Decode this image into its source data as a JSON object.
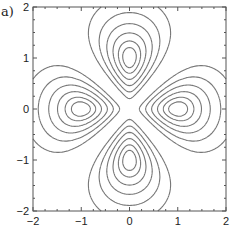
{
  "figure": {
    "label": "a)"
  },
  "chart_data": {
    "type": "contour",
    "title": "",
    "xlabel": "",
    "ylabel": "",
    "xlim": [
      -2,
      2
    ],
    "ylim": [
      -2,
      2
    ],
    "xticks": [
      -2,
      -1,
      0,
      1,
      2
    ],
    "yticks": [
      -2,
      -1,
      0,
      1,
      2
    ],
    "xtick_labels": [
      "−2",
      "−1",
      "0",
      "1",
      "2"
    ],
    "ytick_labels": [
      "−2",
      "−1",
      "0",
      "1",
      "2"
    ],
    "grid": false,
    "legend": null,
    "function": "r^2 * cos(2*theta)^2 * exp(-r^2)",
    "levels": [
      0.04,
      0.1,
      0.17,
      0.24,
      0.3,
      0.34
    ],
    "lobe_maxima": [
      [
        1,
        0
      ],
      [
        -1,
        0
      ],
      [
        0,
        1
      ],
      [
        0,
        -1
      ]
    ],
    "line_color": "#777777",
    "frame_color": "#555555"
  }
}
